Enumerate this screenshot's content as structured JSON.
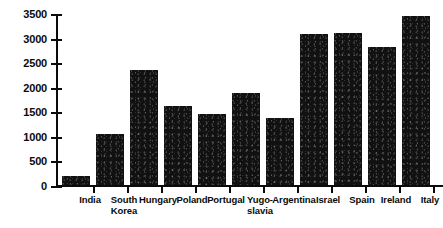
{
  "chart_data": {
    "type": "bar",
    "title": "",
    "subtitle": "",
    "xlabel": "",
    "ylabel": "",
    "ylim": [
      0,
      3500
    ],
    "yticks": [
      0,
      500,
      1000,
      1500,
      2000,
      2500,
      3000,
      3500
    ],
    "ytick_labels": [
      "0",
      "500",
      "1000",
      "1500",
      "2000",
      "2500",
      "3000",
      "3500"
    ],
    "grid": false,
    "legend": null,
    "legend_position": "none",
    "bar_color": "#111111",
    "axis_color": "#0b0b0b",
    "background_color": "#ffffff",
    "categories": [
      "India",
      "South Korea",
      "Hungary",
      "Poland",
      "Portugal",
      "Yugoslavia",
      "Argentina",
      "Israel",
      "Spain",
      "Ireland",
      "Italy"
    ],
    "category_label_lines": [
      [
        "India"
      ],
      [
        "South",
        "Korea"
      ],
      [
        "Hungary"
      ],
      [
        "Poland"
      ],
      [
        "Portugal"
      ],
      [
        "Yugo-",
        "slavia"
      ],
      [
        "Argentina"
      ],
      [
        "Israel"
      ],
      [
        "Spain"
      ],
      [
        "Ireland"
      ],
      [
        "Italy"
      ]
    ],
    "values": [
      230,
      1070,
      2380,
      1650,
      1480,
      1910,
      1400,
      3120,
      3140,
      2850,
      3480
    ]
  }
}
